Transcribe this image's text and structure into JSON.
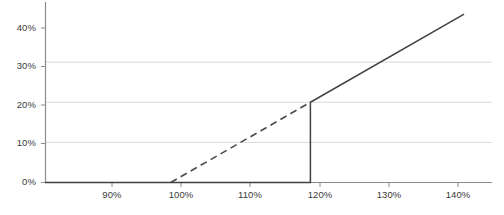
{
  "chart_data": {
    "type": "line",
    "title": "",
    "xlabel": "",
    "ylabel": "",
    "xlim": [
      82,
      146
    ],
    "ylim": [
      0,
      45
    ],
    "grid": true,
    "legend": "none",
    "x_ticks": [
      "90%",
      "100%",
      "110%",
      "120%",
      "130%",
      "140%"
    ],
    "x_tick_values": [
      90,
      100,
      110,
      120,
      130,
      140
    ],
    "y_ticks": [
      "0%",
      "10%",
      "20%",
      "30%",
      "40%"
    ],
    "y_tick_values": [
      0,
      10,
      20,
      30,
      40
    ],
    "series": [
      {
        "name": "actual-payout",
        "style": "solid",
        "color": "#404040",
        "points": [
          {
            "x": 82,
            "y": 0
          },
          {
            "x": 120,
            "y": 0
          },
          {
            "x": 120,
            "y": 20
          },
          {
            "x": 142,
            "y": 42
          }
        ]
      },
      {
        "name": "reference-line",
        "style": "dashed",
        "color": "#4a4a4a",
        "points": [
          {
            "x": 100,
            "y": 0
          },
          {
            "x": 120,
            "y": 20
          }
        ]
      }
    ]
  },
  "axis": {
    "y_axis_name": "y-axis",
    "x_axis_name": "x-axis",
    "gridline_color": "#d9d9d9",
    "axis_color": "#8c8c8c"
  },
  "caption": {
    "text": ""
  }
}
